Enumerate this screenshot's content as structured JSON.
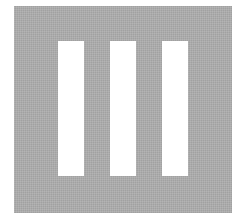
{
  "figure": {
    "background_color": "#ffffff",
    "square_color": "#ababab",
    "bar_color": "#ffffff",
    "bar_count": 3,
    "bars": [
      {
        "id": 1
      },
      {
        "id": 2
      },
      {
        "id": 3
      }
    ]
  }
}
